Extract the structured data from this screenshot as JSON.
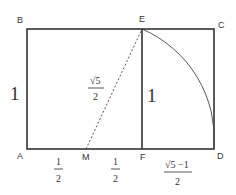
{
  "figure": {
    "points": {
      "A": "A",
      "B": "B",
      "C": "C",
      "D": "D",
      "E": "E",
      "F": "F",
      "M": "M"
    },
    "labels": {
      "side_AB": "1",
      "side_EF": "1",
      "ME_num": "√5",
      "ME_den": "2",
      "AM_num": "1",
      "AM_den": "2",
      "MF_num": "1",
      "MF_den": "2",
      "FD_num": "√5 −1",
      "FD_den": "2"
    }
  }
}
